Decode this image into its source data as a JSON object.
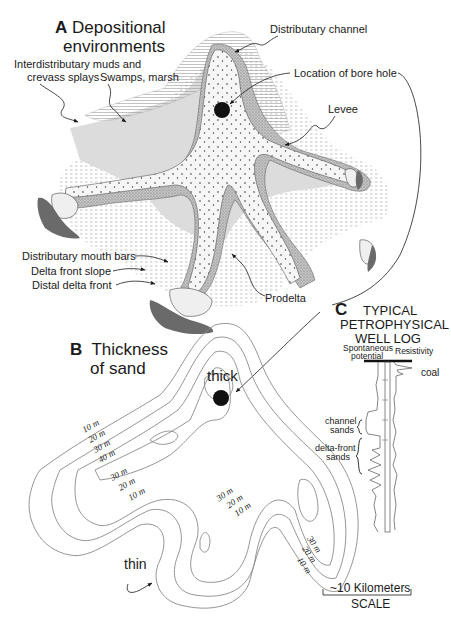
{
  "panel_a": {
    "letter": "A",
    "title_line1": "Depositional",
    "title_line2": "environments",
    "labels": {
      "interdistributary_1": "Interdistributary muds and",
      "interdistributary_2": "crevass splays",
      "swamps": "Swamps, marsh",
      "distributary_channel": "Distributary channel",
      "bore_hole": "Location of bore hole",
      "levee": "Levee",
      "mouth_bars": "Distributary mouth bars",
      "delta_front_slope": "Delta front slope",
      "distal_delta_front": "Distal delta front",
      "prodelta": "Prodelta"
    }
  },
  "panel_b": {
    "letter": "B",
    "title_line1": "Thickness",
    "title_line2": "of sand",
    "thick_label": "thick",
    "thin_label": "thin",
    "contours_left": [
      "10 m",
      "20 m",
      "30 m",
      "40 m"
    ],
    "contours_mid_left": [
      "30 m",
      "20 m",
      "10 m"
    ],
    "contours_mid": [
      "30 m",
      "20 m",
      "10 m"
    ],
    "contours_right": [
      "30 m",
      "20 m",
      "10 m"
    ],
    "scale_value": "~10 Kilometers",
    "scale_label": "SCALE"
  },
  "panel_c": {
    "letter": "C",
    "title_line1": "TYPICAL",
    "title_line2": "PETROPHYSICAL",
    "title_line3": "WELL LOG",
    "sp_label_1": "Spontaneous",
    "sp_label_2": "potential",
    "resistivity_label": "Resistivity",
    "coal_label": "coal",
    "channel_sands_1": "channel",
    "channel_sands_2": "sands",
    "delta_front_1": "delta-front",
    "delta_front_2": "sands"
  },
  "colors": {
    "ink": "#1a1a1a",
    "sand_light": "#f4f4f4",
    "levee_stipple": "#b8b8b8",
    "prodelta_grey": "#d8d8d8",
    "distal_dark": "#6a6a6a",
    "contour_line": "#8a8a8a"
  }
}
